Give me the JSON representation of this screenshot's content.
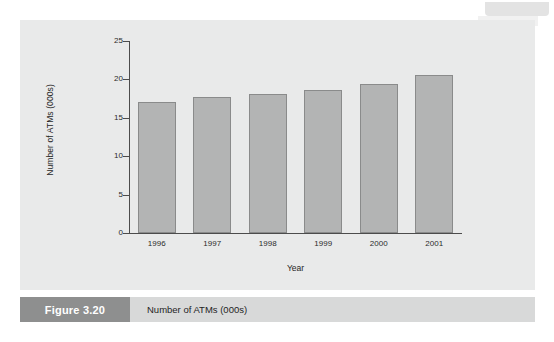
{
  "figure": {
    "number_label": "Figure 3.20",
    "caption": "Number of ATMs (000s)"
  },
  "chart_data": {
    "type": "bar",
    "title": "",
    "xlabel": "Year",
    "ylabel": "Number of ATMs (000s)",
    "categories": [
      "1996",
      "1997",
      "1998",
      "1999",
      "2000",
      "2001"
    ],
    "values": [
      17.0,
      17.7,
      18.1,
      18.6,
      19.4,
      20.6
    ],
    "ylim": [
      0,
      25
    ],
    "yticks": [
      0,
      5,
      10,
      15,
      20,
      25
    ],
    "ytick_labels": [
      "0",
      "5",
      "10",
      "15",
      "20",
      "25"
    ],
    "grid": false,
    "legend": false,
    "bar_color": "#b3b4b4",
    "bar_border_color": "#8a8b8b",
    "axis_color": "#4c4c4c",
    "panel_background": "#e9eaea"
  }
}
